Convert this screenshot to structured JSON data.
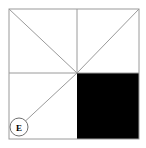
{
  "figure": {
    "background_color": "#ffffff",
    "line_color": "#9a9a9a",
    "fill_color": "#000000",
    "label_color": "#000000",
    "outer_square": {
      "left": 9,
      "top": 9,
      "right": 139,
      "bottom": 139,
      "stroke_width": 1
    },
    "center_point": {
      "x": 77,
      "y": 73
    },
    "grid_lines": [
      {
        "name": "vertical-median",
        "x1": 77,
        "y1": 9,
        "x2": 77,
        "y2": 73
      },
      {
        "name": "horizontal-median",
        "x1": 9,
        "y1": 73,
        "x2": 139,
        "y2": 73
      }
    ],
    "diagonals": [
      {
        "name": "diagonal-top-left-to-center",
        "x1": 9,
        "y1": 9,
        "x2": 77,
        "y2": 73
      },
      {
        "name": "diagonal-top-right-to-center",
        "x1": 139,
        "y1": 9,
        "x2": 77,
        "y2": 73
      },
      {
        "name": "diagonal-bottom-left-to-center",
        "x1": 19,
        "y1": 127,
        "x2": 77,
        "y2": 73
      }
    ],
    "shaded_region": {
      "name": "bottom-right-quadrant",
      "left": 77,
      "top": 73,
      "width": 62,
      "height": 66,
      "color": "#000000"
    },
    "labels": [
      {
        "name": "vertex-label-e",
        "text": "E",
        "circle_center_x": 19,
        "circle_center_y": 127,
        "circle_radius": 9,
        "circle_stroke": "#6f6f6f",
        "text_color": "#000000"
      }
    ]
  }
}
